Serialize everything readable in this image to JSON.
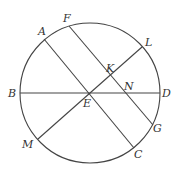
{
  "diagram": {
    "type": "geometry-circle-chords",
    "circle": {
      "cx": 90,
      "cy": 93,
      "r": 70
    },
    "stroke_color": "#444444",
    "points": {
      "A": {
        "x": 44,
        "y": 39
      },
      "F": {
        "x": 69,
        "y": 26
      },
      "L": {
        "x": 142,
        "y": 47
      },
      "K": {
        "x": 110,
        "y": 75
      },
      "N": {
        "x": 125,
        "y": 93
      },
      "B": {
        "x": 20,
        "y": 93
      },
      "D": {
        "x": 160,
        "y": 93
      },
      "E": {
        "x": 89,
        "y": 93
      },
      "M": {
        "x": 38,
        "y": 139
      },
      "G": {
        "x": 153,
        "y": 125
      },
      "C": {
        "x": 134,
        "y": 148
      }
    },
    "segments": [
      {
        "from": "B",
        "to": "D"
      },
      {
        "from": "A",
        "to": "C"
      },
      {
        "from": "F",
        "to": "G"
      },
      {
        "from": "M",
        "to": "L"
      }
    ],
    "labels": {
      "A": "A",
      "F": "F",
      "L": "L",
      "K": "K",
      "N": "N",
      "B": "B",
      "D": "D",
      "E": "E",
      "M": "M",
      "G": "G",
      "C": "C"
    }
  }
}
